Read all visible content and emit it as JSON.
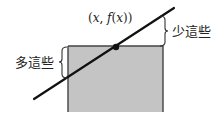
{
  "diagram": {
    "type": "tangent-line-over-rectangle",
    "point_label": "(x, f(x))",
    "point_label_parts": {
      "open": "(",
      "x": "x",
      "sep": ", ",
      "f": "f",
      "inner_open": "(",
      "inner_x": "x",
      "close": "))"
    },
    "right_annotation": "少這些",
    "left_annotation": "多這些",
    "colors": {
      "rect_fill": "#c4c4c4",
      "rect_edge": "#444444",
      "line": "#111111",
      "point": "#111111",
      "brace": "#333333",
      "text": "#222222"
    },
    "geometry": {
      "rect": {
        "x": 68,
        "y": 46,
        "width": 95,
        "height": 66
      },
      "line": {
        "x1": 34,
        "y1": 99,
        "x2": 174,
        "y2": 8
      },
      "point": {
        "cx": 116,
        "cy": 47,
        "r": 3.2
      },
      "right_brace": {
        "x": 164,
        "y_top": 16,
        "y_bottom": 46
      },
      "left_brace": {
        "x": 67,
        "y_top": 47,
        "y_bottom": 78
      }
    }
  }
}
